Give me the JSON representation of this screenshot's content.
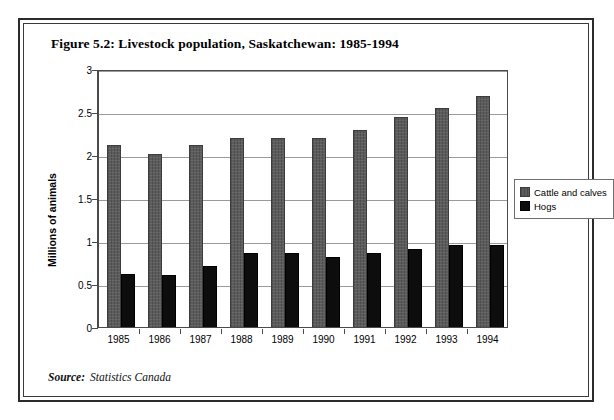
{
  "figure": {
    "title": "Figure 5.2: Livestock population, Saskatchewan: 1985-1994",
    "source_label": "Source:",
    "source_value": "Statistics Canada"
  },
  "legend": {
    "position": "right-middle",
    "entries": [
      {
        "label": "Cattle and calves",
        "color": "#5c5c5c"
      },
      {
        "label": "Hogs",
        "color": "#0d0d0d"
      }
    ]
  },
  "chart_data": {
    "type": "bar",
    "title": "Figure 5.2: Livestock population, Saskatchewan: 1985-1994",
    "xlabel": "",
    "ylabel": "Millions of animals",
    "categories": [
      "1985",
      "1986",
      "1987",
      "1988",
      "1989",
      "1990",
      "1991",
      "1992",
      "1993",
      "1994"
    ],
    "series": [
      {
        "name": "Cattle and calves",
        "color": "#5c5c5c",
        "values": [
          2.1,
          2.0,
          2.1,
          2.19,
          2.19,
          2.19,
          2.28,
          2.43,
          2.54,
          2.68
        ]
      },
      {
        "name": "Hogs",
        "color": "#0d0d0d",
        "values": [
          0.6,
          0.59,
          0.7,
          0.85,
          0.85,
          0.8,
          0.85,
          0.89,
          0.94,
          0.94
        ]
      }
    ],
    "ylim": [
      0,
      3
    ],
    "yticks": [
      0,
      0.5,
      1,
      1.5,
      2,
      2.5,
      3
    ],
    "ytick_labels": [
      "0",
      "0.5",
      "1",
      "1.5",
      "2",
      "2.5",
      "3"
    ],
    "grid": "horizontal",
    "legend_position": "right"
  }
}
